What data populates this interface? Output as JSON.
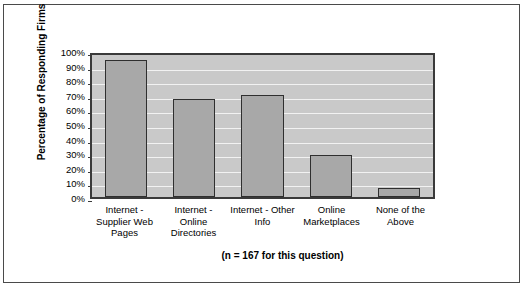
{
  "chart_data": {
    "type": "bar",
    "title": "",
    "subtitle": "",
    "xlabel": "",
    "ylabel": "Percentage of Responding Firms",
    "categories": [
      "Internet - Supplier Web Pages",
      "Internet - Online Directories",
      "Internet - Other Info",
      "Online Marketplaces",
      "None of the Above"
    ],
    "values": [
      94,
      67,
      70,
      29,
      6
    ],
    "ylim": [
      0,
      100
    ],
    "ytick_labels": [
      "100%",
      "90%",
      "80%",
      "70%",
      "60%",
      "50%",
      "40%",
      "30%",
      "20%",
      "10%",
      "0%"
    ],
    "ytick_values": [
      100,
      90,
      80,
      70,
      60,
      50,
      40,
      30,
      20,
      10,
      0
    ],
    "grid": true,
    "legend": "none",
    "annotation": "(n = 167 for this question)",
    "bar_color": "#a8a8a8",
    "bar_border_color": "#2f2f2f",
    "plot_background": "#c9c9c9",
    "gridline_color": "#f2f2f2",
    "axis_color": "#3a3a3a"
  }
}
